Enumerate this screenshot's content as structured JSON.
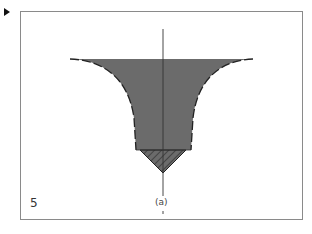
{
  "figure": {
    "panel_number": "5",
    "caption": "(a)",
    "colors": {
      "fill": "#6b6b6b",
      "outline": "#222222",
      "frame": "#8a8a8a",
      "axis": "#333333"
    },
    "shapes": {
      "funnel": "shaded flared funnel body with curved concave sides",
      "tip": "hatched inverted triangle below funnel neck",
      "axis": "vertical center axis line"
    }
  }
}
